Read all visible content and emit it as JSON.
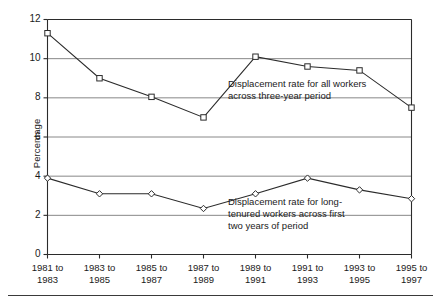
{
  "chart_data": {
    "type": "line",
    "title": "",
    "xlabel": "",
    "ylabel": "Percentage",
    "ylim": [
      0,
      12
    ],
    "yticks": [
      0,
      2,
      4,
      6,
      8,
      10,
      12
    ],
    "grid": true,
    "legend_position": "inline-annotations",
    "categories": [
      "1981 to 1983",
      "1983 to 1985",
      "1985 to 1987",
      "1987 to 1989",
      "1989 to 1991",
      "1991 to 1993",
      "1993 to 1995",
      "1995 to 1997"
    ],
    "category_lines": [
      [
        "1981 to",
        "1983"
      ],
      [
        "1983 to",
        "1985"
      ],
      [
        "1985 to",
        "1987"
      ],
      [
        "1987 to",
        "1989"
      ],
      [
        "1989 to",
        "1991"
      ],
      [
        "1991 to",
        "1993"
      ],
      [
        "1993 to",
        "1995"
      ],
      [
        "1995 to",
        "1997"
      ]
    ],
    "series": [
      {
        "name": "Displacement rate for all workers across three-year period",
        "marker": "square",
        "values": [
          11.3,
          9.0,
          8.05,
          7.0,
          10.1,
          9.6,
          9.4,
          7.5
        ]
      },
      {
        "name": "Displacement rate for long-tenured workers across first two years of period",
        "marker": "diamond",
        "values": [
          3.9,
          3.1,
          3.1,
          2.35,
          3.1,
          3.9,
          3.3,
          2.85
        ]
      }
    ],
    "annotations": [
      {
        "id": "upper-annotation",
        "lines": [
          "Displacement rate for all workers",
          "across three-year period"
        ]
      },
      {
        "id": "lower-annotation",
        "lines": [
          "Displacement rate for long-",
          "tenured workers across first",
          "two years of period"
        ]
      }
    ],
    "colors": {
      "line": "#2b2b2b",
      "grid": "#7a7a7a",
      "axis": "#2b2b2b",
      "marker_fill": "#ffffff",
      "background": "#ffffff"
    }
  }
}
